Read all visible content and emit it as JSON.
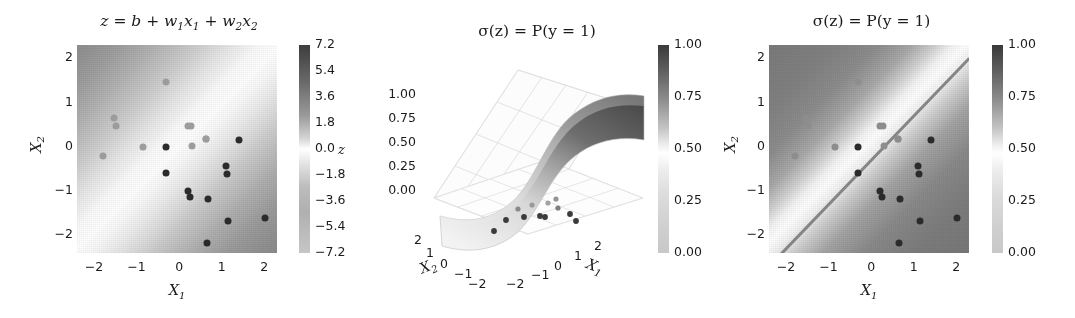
{
  "figure": {
    "panel_count": 3,
    "background": "#ffffff"
  },
  "panels": {
    "linear": {
      "title_plain": "z = b + w1x1 + w2x2",
      "title_parts": {
        "lead": "z = b + w",
        "s1": "1",
        "mid1": "x",
        "s2": "1",
        "mid2": " + w",
        "s3": "2",
        "mid3": "x",
        "s4": "2"
      },
      "xlabel": "X",
      "xlabel_sub": "1",
      "ylabel": "X",
      "ylabel_sub": "2",
      "xticks": [
        "-2",
        "-1",
        "0",
        "1",
        "2"
      ],
      "yticks": [
        "2",
        "1",
        "0",
        "-1",
        "-2"
      ],
      "colorbar_label": "z",
      "colorbar_ticks": [
        "7.2",
        "5.4",
        "3.6",
        "1.8",
        "0.0",
        "-1.8",
        "-3.6",
        "-5.4",
        "-7.2"
      ]
    },
    "surface": {
      "title_plain": "sigma(z) = P(y = 1)",
      "title_text": "σ(z) = P(y = 1)",
      "zticks": [
        "1.00",
        "0.75",
        "0.50",
        "0.25",
        "0.00"
      ],
      "x2ticks": [
        "2",
        "1",
        "0",
        "-1",
        "-2"
      ],
      "x1ticks": [
        "-2",
        "-1",
        "0",
        "1",
        "2"
      ],
      "xlabel": "X",
      "xlabel_sub": "1",
      "ylabel": "X",
      "ylabel_sub": "2",
      "colorbar_ticks": [
        "1.00",
        "0.75",
        "0.50",
        "0.25",
        "0.00"
      ]
    },
    "probability": {
      "title_plain": "sigma(z) = P(y = 1)",
      "title_text": "σ(z) = P(y = 1)",
      "xlabel": "X",
      "xlabel_sub": "1",
      "ylabel": "X",
      "ylabel_sub": "2",
      "xticks": [
        "-2",
        "-1",
        "0",
        "1",
        "2"
      ],
      "yticks": [
        "2",
        "1",
        "0",
        "-1",
        "-2"
      ],
      "colorbar_ticks": [
        "1.00",
        "0.75",
        "0.50",
        "0.25",
        "0.00"
      ]
    }
  },
  "chart_data": [
    {
      "type": "heatmap",
      "name": "linear-score-field",
      "title": "z = b + w₁x₁ + w₂x₂",
      "xlabel": "X₁",
      "ylabel": "X₂",
      "xlim": [
        -2.4,
        2.3
      ],
      "ylim": [
        -2.4,
        2.3
      ],
      "xticks": [
        -2,
        -1,
        0,
        1,
        2
      ],
      "yticks": [
        -2,
        -1,
        0,
        1,
        2
      ],
      "colorbar": {
        "label": "z",
        "ticks": [
          7.2,
          5.4,
          3.6,
          1.8,
          0.0,
          -1.8,
          -3.6,
          -5.4,
          -7.2
        ],
        "vmin": -7.2,
        "vmax": 7.2,
        "cmap": "gray-diverging"
      },
      "field": {
        "function": "z = b + w1*x1 + w2*x2",
        "note": "diagonal bands; high z upper-left, low z lower-right; zero contour runs lower-left to upper-right",
        "zero_line_slope": 1.0,
        "zero_line_intercept": -0.28
      },
      "scatter": {
        "x": [
          -1.78,
          -1.52,
          -1.48,
          -0.85,
          -0.32,
          -0.3,
          -0.3,
          0.28,
          0.2,
          0.3,
          0.62,
          0.62,
          0.22,
          0.26,
          0.68,
          1.1,
          1.12,
          1.4,
          1.14,
          2.02,
          0.66
        ],
        "y": [
          -0.2,
          0.64,
          0.48,
          0.0,
          1.46,
          0.0,
          -0.6,
          0.46,
          0.46,
          0.02,
          0.18,
          0.18,
          -1.0,
          -1.14,
          -1.18,
          -0.44,
          -0.62,
          0.16,
          -1.68,
          -1.62,
          -2.18
        ],
        "class": [
          0,
          0,
          0,
          0,
          0,
          1,
          1,
          0,
          0,
          0,
          0,
          0,
          1,
          1,
          1,
          1,
          1,
          1,
          1,
          1,
          1
        ]
      }
    },
    {
      "type": "surface",
      "name": "sigmoid-surface-3d",
      "title": "σ(z) = P(y = 1)",
      "xlabel": "X₁",
      "ylabel": "X₂",
      "zlabel": "",
      "zticks": [
        0.0,
        0.25,
        0.5,
        0.75,
        1.0
      ],
      "zlim": [
        0.0,
        1.0
      ],
      "x1ticks": [
        -2,
        -1,
        0,
        1,
        2
      ],
      "x2ticks": [
        -2,
        -1,
        0,
        1,
        2
      ],
      "colorbar": {
        "ticks": [
          1.0,
          0.75,
          0.5,
          0.25,
          0.0
        ],
        "vmin": 0.0,
        "vmax": 1.0,
        "cmap": "gray"
      },
      "surface_note": "logistic sigmoid sheet rising from ~0 at front-left to ~1 at back-right, with S-shaped transition across the diagonal",
      "projected_points_note": "data points drawn flat on the z=0 floor of the 3D box"
    },
    {
      "type": "heatmap",
      "name": "probability-field",
      "title": "σ(z) = P(y = 1)",
      "xlabel": "X₁",
      "ylabel": "X₂",
      "xlim": [
        -2.4,
        2.3
      ],
      "ylim": [
        -2.4,
        2.3
      ],
      "xticks": [
        -2,
        -1,
        0,
        1,
        2
      ],
      "yticks": [
        -2,
        -1,
        0,
        1,
        2
      ],
      "colorbar": {
        "ticks": [
          1.0,
          0.75,
          0.5,
          0.25,
          0.0
        ],
        "vmin": 0.0,
        "vmax": 1.0,
        "cmap": "gray"
      },
      "decision_boundary": {
        "level": 0.5,
        "slope": 1.0,
        "intercept": -0.28,
        "visible": true
      },
      "field": {
        "note": "probability near 1 upper-left, near 0 lower-right, sharp 0.5 transition band along the boundary line"
      },
      "scatter": {
        "x": [
          -1.78,
          -1.52,
          -1.48,
          -0.85,
          -0.32,
          -0.3,
          -0.3,
          0.28,
          0.2,
          0.3,
          0.62,
          0.62,
          0.22,
          0.26,
          0.68,
          1.1,
          1.12,
          1.4,
          1.14,
          2.02,
          0.66
        ],
        "y": [
          -0.2,
          0.64,
          0.48,
          0.0,
          1.46,
          0.0,
          -0.6,
          0.46,
          0.46,
          0.02,
          0.18,
          0.18,
          -1.0,
          -1.14,
          -1.18,
          -0.44,
          -0.62,
          0.16,
          -1.68,
          -1.62,
          -2.18
        ],
        "class": [
          0,
          0,
          0,
          0,
          0,
          1,
          1,
          0,
          0,
          0,
          0,
          0,
          1,
          1,
          1,
          1,
          1,
          1,
          1,
          1,
          1
        ]
      }
    }
  ]
}
